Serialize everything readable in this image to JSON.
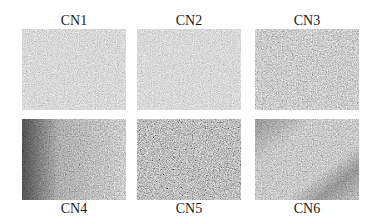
{
  "figure": {
    "panels": [
      {
        "id": "CN1",
        "label": "CN1",
        "position": "top-left",
        "tone": "light-gray speckled"
      },
      {
        "id": "CN2",
        "label": "CN2",
        "position": "top-center",
        "tone": "light-gray speckled"
      },
      {
        "id": "CN3",
        "label": "CN3",
        "position": "top-right",
        "tone": "medium-gray speckled"
      },
      {
        "id": "CN4",
        "label": "CN4",
        "position": "bottom-left",
        "tone": "dark left edge, lighter center"
      },
      {
        "id": "CN5",
        "label": "CN5",
        "position": "bottom-center",
        "tone": "dark speckled"
      },
      {
        "id": "CN6",
        "label": "CN6",
        "position": "bottom-right",
        "tone": "medium-gray with diagonal dark band"
      }
    ],
    "colors": {
      "background": "#ffffff",
      "label_text": "#1a1a1a",
      "texture_base": "#b8b8b8"
    }
  }
}
